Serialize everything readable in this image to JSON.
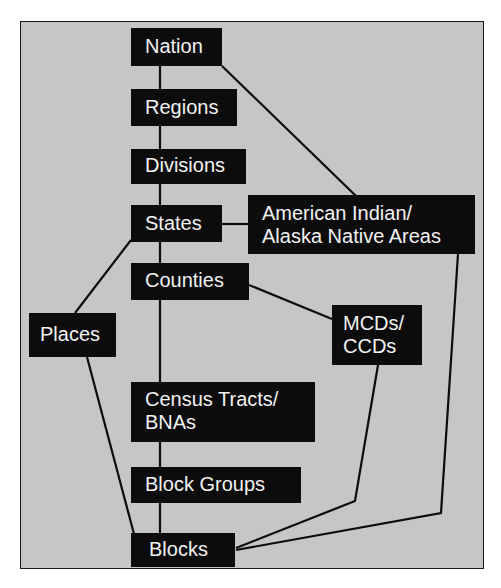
{
  "diagram": {
    "colors": {
      "background": "#c6c6c6",
      "node": "#0c0c0c",
      "text": "#f2f2f2",
      "line": "#0c0c0c"
    },
    "nodes": {
      "nation": {
        "lines": [
          "Nation"
        ]
      },
      "regions": {
        "lines": [
          "Regions"
        ]
      },
      "divisions": {
        "lines": [
          "Divisions"
        ]
      },
      "states": {
        "lines": [
          "States"
        ]
      },
      "aian": {
        "lines": [
          "American Indian/",
          "Alaska Native Areas"
        ]
      },
      "counties": {
        "lines": [
          "Counties"
        ]
      },
      "places": {
        "lines": [
          "Places"
        ]
      },
      "mcds": {
        "lines": [
          "MCDs/",
          "CCDs"
        ]
      },
      "tracts": {
        "lines": [
          "Census Tracts/",
          "BNAs"
        ]
      },
      "blockgroups": {
        "lines": [
          "Block Groups"
        ]
      },
      "blocks": {
        "lines": [
          "Blocks"
        ]
      }
    },
    "edges": [
      [
        "Nation",
        "Regions"
      ],
      [
        "Regions",
        "Divisions"
      ],
      [
        "Divisions",
        "States"
      ],
      [
        "States",
        "Counties"
      ],
      [
        "Counties",
        "Census Tracts/BNAs"
      ],
      [
        "Census Tracts/BNAs",
        "Block Groups"
      ],
      [
        "Block Groups",
        "Blocks"
      ],
      [
        "Nation",
        "American Indian/Alaska Native Areas"
      ],
      [
        "States",
        "American Indian/Alaska Native Areas"
      ],
      [
        "States",
        "Places"
      ],
      [
        "Places",
        "Blocks"
      ],
      [
        "Counties",
        "MCDs/CCDs"
      ],
      [
        "MCDs/CCDs",
        "Blocks"
      ],
      [
        "American Indian/Alaska Native Areas",
        "Blocks"
      ]
    ]
  }
}
